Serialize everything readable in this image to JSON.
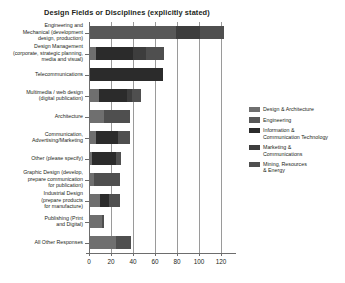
{
  "chart_data": {
    "type": "bar",
    "orientation": "horizontal",
    "stacked": true,
    "title": "Design Fields or Disciplines (explicitly stated)",
    "xlabel": "",
    "ylabel": "",
    "xlim": [
      0,
      130
    ],
    "xticks": [
      0,
      20,
      40,
      60,
      80,
      100,
      120
    ],
    "xtick_labels": [
      "0",
      "20",
      "40",
      "60",
      "80",
      "100",
      "120"
    ],
    "grid": true,
    "grid_axis": "x",
    "legend_position": "right",
    "categories": [
      "Engineering and\nMechanical (development\ndesign, production)",
      "Design Management\n(corporate, strategic planning,\nmedia and visual)",
      "Telecommunications",
      "Multimedia / web design\n(digital publication)",
      "Architecture",
      "Communication,\nAdvertising/Marketing",
      "Other (please specify)",
      "Graphic Design (develop,\nprepare communication\nfor publication)",
      "Industrial Design\n(prepare products\nfor manufacture)",
      "Publishing (Print\nand Digital)",
      "All Other Responses"
    ],
    "series": [
      {
        "name": "Design & Architecture",
        "color": "#6f6f6f",
        "values": [
          0,
          5,
          0,
          8,
          13,
          5,
          2,
          4,
          9,
          11,
          24
        ]
      },
      {
        "name": "Engineering",
        "color": "#585858",
        "values": [
          78,
          0,
          0,
          0,
          0,
          0,
          0,
          0,
          0,
          0,
          0
        ]
      },
      {
        "name": "Information & Communication Technology",
        "color": "#2b2b2b",
        "values": [
          0,
          34,
          66,
          26,
          0,
          20,
          22,
          0,
          8,
          0,
          0
        ]
      },
      {
        "name": "Marketing & Communications",
        "color": "#3d3d3d",
        "values": [
          22,
          12,
          0,
          4,
          0,
          0,
          0,
          0,
          0,
          0,
          0
        ]
      },
      {
        "name": "Mining, Resources & Energy",
        "color": "#4f4f4f",
        "values": [
          22,
          16,
          0,
          8,
          23,
          11,
          4,
          23,
          10,
          2,
          13
        ]
      }
    ],
    "totals": [
      122,
      67,
      66,
      46,
      36,
      36,
      28,
      27,
      27,
      13,
      37
    ]
  },
  "legend": {
    "items": [
      {
        "label": "Design & Architecture",
        "color": "#6f6f6f"
      },
      {
        "label": "Engineering",
        "color": "#585858"
      },
      {
        "label": "Information &\nCommunication Technology",
        "color": "#2b2b2b"
      },
      {
        "label": "Marketing &\nCommunications",
        "color": "#3d3d3d"
      },
      {
        "label": "Mining, Resources\n& Energy",
        "color": "#4f4f4f"
      }
    ]
  },
  "colors": {
    "axis": "#6d6d6d",
    "grid": "#9a9a9a",
    "text": "#231f20",
    "background": "#ffffff"
  }
}
